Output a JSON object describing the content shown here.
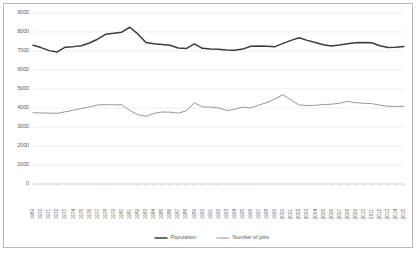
{
  "chart_data": {
    "type": "line",
    "title": "",
    "subtitle": "",
    "xlabel": "",
    "ylabel": "",
    "grid": true,
    "legend_position": "bottom",
    "ylim": [
      0,
      9000
    ],
    "yticks": [
      0,
      1000,
      2000,
      3000,
      4000,
      5000,
      6000,
      7000,
      8000,
      9000
    ],
    "ytick_labels": [
      "0",
      "1000",
      "2000",
      "3000",
      "4000",
      "5000",
      "6000",
      "7000",
      "8000",
      "9000"
    ],
    "categories": [
      "1969",
      "1970",
      "1971",
      "1972",
      "1973",
      "1974",
      "1975",
      "1976",
      "1977",
      "1978",
      "1979",
      "1980",
      "1981",
      "1982",
      "1983",
      "1984",
      "1985",
      "1986",
      "1987",
      "1988",
      "1989",
      "1990",
      "1991",
      "1992",
      "1993",
      "1994",
      "1995",
      "1996",
      "1997",
      "1998",
      "1999",
      "2000",
      "2001",
      "2002",
      "2003",
      "2004",
      "2005",
      "2006",
      "2007",
      "2008",
      "2009",
      "2010",
      "2011",
      "2012",
      "2013",
      "2014",
      "2015"
    ],
    "series": [
      {
        "name": "Population",
        "color": "#3b3b3b",
        "line_width": 1.5,
        "values": [
          7300,
          7180,
          7020,
          6950,
          7200,
          7230,
          7280,
          7420,
          7620,
          7880,
          7930,
          7990,
          8250,
          7900,
          7450,
          7380,
          7340,
          7300,
          7160,
          7130,
          7380,
          7140,
          7110,
          7090,
          7050,
          7040,
          7100,
          7250,
          7260,
          7250,
          7230,
          7400,
          7560,
          7700,
          7560,
          7450,
          7330,
          7260,
          7310,
          7380,
          7430,
          7450,
          7430,
          7280,
          7180,
          7200,
          7240
        ]
      },
      {
        "name": "Number of jobs",
        "color": "#8c8c8c",
        "line_width": 0.9,
        "values": [
          3750,
          3740,
          3730,
          3720,
          3800,
          3880,
          3970,
          4060,
          4160,
          4180,
          4160,
          4180,
          3870,
          3650,
          3560,
          3720,
          3790,
          3780,
          3730,
          3850,
          4280,
          4060,
          4050,
          4010,
          3870,
          3930,
          4050,
          4010,
          4150,
          4290,
          4480,
          4700,
          4420,
          4160,
          4130,
          4140,
          4180,
          4200,
          4250,
          4350,
          4280,
          4250,
          4230,
          4150,
          4090,
          4080,
          4090
        ]
      }
    ]
  },
  "legend": {
    "entries": [
      {
        "label": "Population"
      },
      {
        "label": "Number of jobs"
      }
    ]
  }
}
